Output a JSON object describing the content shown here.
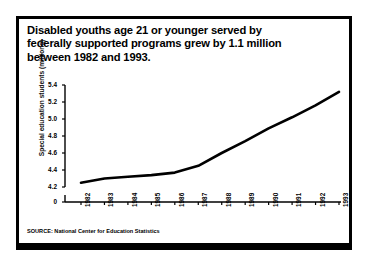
{
  "figure": {
    "title_lines": [
      "Disabled youths age 21 or younger served by",
      "federally supported programs grew by 1.1 million",
      "between 1982 and 1993."
    ],
    "source": "SOURCE: National Center for Education Statistics"
  },
  "chart_data": {
    "type": "line",
    "title": "Disabled youths age 21 or younger served by federally supported programs grew by 1.1 million between 1982 and 1993.",
    "xlabel": "",
    "ylabel": "Special education students (millions)",
    "categories": [
      "1982",
      "1983",
      "1984",
      "1985",
      "1986",
      "1987",
      "1988",
      "1989",
      "1990",
      "1991",
      "1992",
      "1993"
    ],
    "values": [
      4.25,
      4.3,
      4.32,
      4.34,
      4.37,
      4.45,
      4.6,
      4.74,
      4.89,
      5.02,
      5.16,
      5.32
    ],
    "ytick_labels": [
      "5.4",
      "5.2",
      "5.0",
      "4.8",
      "4.6",
      "4.4",
      "4.2",
      "0"
    ],
    "ytick_values": [
      5.4,
      5.2,
      5.0,
      4.8,
      4.6,
      4.4,
      4.2,
      0
    ],
    "ylim": [
      4.15,
      5.45
    ],
    "axis_break": true,
    "grid": false,
    "legend": "none",
    "line_color": "#000000",
    "line_width": 2.6,
    "series": [
      {
        "name": "Special education students (millions)",
        "values": [
          4.25,
          4.3,
          4.32,
          4.34,
          4.37,
          4.45,
          4.6,
          4.74,
          4.89,
          5.02,
          5.16,
          5.32
        ]
      }
    ]
  }
}
